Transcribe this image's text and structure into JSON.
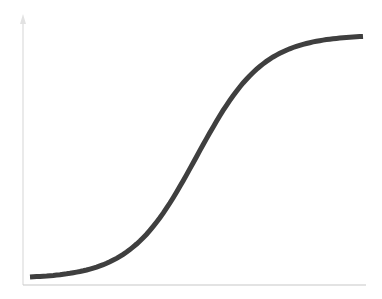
{
  "chart_data": {
    "type": "line",
    "title": "",
    "xlabel": "",
    "ylabel": "",
    "legend": [],
    "grid": false,
    "x": [
      0,
      0.1,
      0.2,
      0.3,
      0.4,
      0.5,
      0.6,
      0.7,
      0.8,
      0.9,
      1.0
    ],
    "series": [
      {
        "name": "sigmoid",
        "values": [
          0.03,
          0.06,
          0.13,
          0.25,
          0.42,
          0.5,
          0.69,
          0.83,
          0.92,
          0.97,
          1.0
        ]
      }
    ],
    "xlim": [
      0,
      1
    ],
    "ylim": [
      0,
      1.05
    ],
    "style": {
      "line_color": "#3f3f3f",
      "axis_color": "#d9d9d9",
      "line_width": 5
    }
  }
}
